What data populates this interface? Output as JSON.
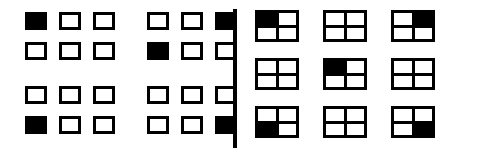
{
  "figure": {
    "title": "",
    "background_color": "#ffffff",
    "stroke_color": "#000000",
    "fill_color": "#000000",
    "width": 484,
    "height": 156
  },
  "divider": {
    "name": "vertical-divider",
    "orientation": "vertical",
    "color": "#000000"
  },
  "left_panel": {
    "name": "left-panel",
    "description": "four blocks, each a 3x2 arrangement of rectangular cells",
    "blocks": [
      {
        "id": "block-top-left",
        "position": "top-left",
        "columns": 3,
        "rows": 2,
        "cells": [
          {
            "index": 0,
            "row": 0,
            "col": 0,
            "filled": true
          },
          {
            "index": 1,
            "row": 0,
            "col": 1,
            "filled": false
          },
          {
            "index": 2,
            "row": 0,
            "col": 2,
            "filled": false
          },
          {
            "index": 3,
            "row": 1,
            "col": 0,
            "filled": false
          },
          {
            "index": 4,
            "row": 1,
            "col": 1,
            "filled": false
          },
          {
            "index": 5,
            "row": 1,
            "col": 2,
            "filled": false
          }
        ]
      },
      {
        "id": "block-top-right",
        "position": "top-right",
        "columns": 3,
        "rows": 2,
        "cells": [
          {
            "index": 0,
            "row": 0,
            "col": 0,
            "filled": false
          },
          {
            "index": 1,
            "row": 0,
            "col": 1,
            "filled": false
          },
          {
            "index": 2,
            "row": 0,
            "col": 2,
            "filled": true
          },
          {
            "index": 3,
            "row": 1,
            "col": 0,
            "filled": true
          },
          {
            "index": 4,
            "row": 1,
            "col": 1,
            "filled": false
          },
          {
            "index": 5,
            "row": 1,
            "col": 2,
            "filled": false
          }
        ]
      },
      {
        "id": "block-bottom-left",
        "position": "bottom-left",
        "columns": 3,
        "rows": 2,
        "cells": [
          {
            "index": 0,
            "row": 0,
            "col": 0,
            "filled": false
          },
          {
            "index": 1,
            "row": 0,
            "col": 1,
            "filled": false
          },
          {
            "index": 2,
            "row": 0,
            "col": 2,
            "filled": false
          },
          {
            "index": 3,
            "row": 1,
            "col": 0,
            "filled": true
          },
          {
            "index": 4,
            "row": 1,
            "col": 1,
            "filled": false
          },
          {
            "index": 5,
            "row": 1,
            "col": 2,
            "filled": false
          }
        ]
      },
      {
        "id": "block-bottom-right",
        "position": "bottom-right",
        "columns": 3,
        "rows": 2,
        "cells": [
          {
            "index": 0,
            "row": 0,
            "col": 0,
            "filled": false
          },
          {
            "index": 1,
            "row": 0,
            "col": 1,
            "filled": false
          },
          {
            "index": 2,
            "row": 0,
            "col": 2,
            "filled": false
          },
          {
            "index": 3,
            "row": 1,
            "col": 0,
            "filled": false
          },
          {
            "index": 4,
            "row": 1,
            "col": 1,
            "filled": false
          },
          {
            "index": 5,
            "row": 1,
            "col": 2,
            "filled": true
          }
        ]
      }
    ]
  },
  "right_panel": {
    "name": "right-panel",
    "description": "3x3 grid of quad boxes, each subdivided into 2x2 quadrants",
    "columns": 3,
    "rows": 3,
    "quads": [
      {
        "index": 0,
        "row": 0,
        "col": 0,
        "quadrants": [
          true,
          false,
          false,
          false
        ]
      },
      {
        "index": 1,
        "row": 0,
        "col": 1,
        "quadrants": [
          false,
          false,
          false,
          false
        ]
      },
      {
        "index": 2,
        "row": 0,
        "col": 2,
        "quadrants": [
          false,
          true,
          false,
          false
        ]
      },
      {
        "index": 3,
        "row": 1,
        "col": 0,
        "quadrants": [
          false,
          false,
          false,
          false
        ]
      },
      {
        "index": 4,
        "row": 1,
        "col": 1,
        "quadrants": [
          true,
          false,
          false,
          false
        ]
      },
      {
        "index": 5,
        "row": 1,
        "col": 2,
        "quadrants": [
          false,
          false,
          false,
          false
        ]
      },
      {
        "index": 6,
        "row": 2,
        "col": 0,
        "quadrants": [
          false,
          false,
          true,
          false
        ]
      },
      {
        "index": 7,
        "row": 2,
        "col": 1,
        "quadrants": [
          false,
          false,
          false,
          false
        ]
      },
      {
        "index": 8,
        "row": 2,
        "col": 2,
        "quadrants": [
          false,
          false,
          false,
          true
        ]
      }
    ]
  }
}
